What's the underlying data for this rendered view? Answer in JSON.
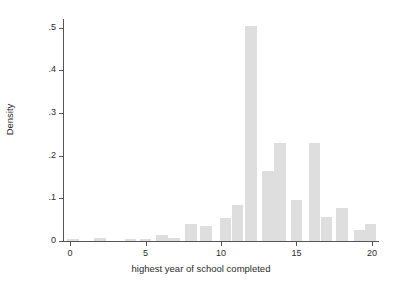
{
  "chart_data": {
    "type": "bar",
    "title": "",
    "subtitle": "",
    "xlabel": "highest year of school completed",
    "ylabel": "Density",
    "xlim": [
      -0.4,
      20.4
    ],
    "ylim": [
      0,
      0.52
    ],
    "xticks": [
      "0",
      "5",
      "10",
      "15",
      "20"
    ],
    "xtick_values": [
      0,
      5,
      10,
      15,
      20
    ],
    "yticks": [
      "0",
      ".1",
      ".2",
      ".3",
      ".4",
      ".5"
    ],
    "ytick_values": [
      0,
      0.1,
      0.2,
      0.3,
      0.4,
      0.5
    ],
    "grid": false,
    "legend": "none",
    "bar_color": "#dedede",
    "axis_color": "#555555",
    "text_color": "#2b2b2b",
    "background": "#ffffff",
    "bin_width": 0.77,
    "x": [
      0.2,
      2.0,
      4.0,
      5.0,
      6.1,
      6.9,
      8.0,
      9.0,
      10.3,
      11.1,
      12.0,
      13.1,
      13.9,
      15.0,
      16.2,
      17.0,
      18.0,
      19.2,
      19.9
    ],
    "values": [
      0.004,
      0.008,
      0.004,
      0.004,
      0.013,
      0.006,
      0.039,
      0.036,
      0.054,
      0.085,
      0.503,
      0.163,
      0.229,
      0.096,
      0.23,
      0.056,
      0.078,
      0.025,
      0.041
    ],
    "bars": [
      {
        "x": 0.2,
        "density": 0.004
      },
      {
        "x": 2.0,
        "density": 0.008
      },
      {
        "x": 4.0,
        "density": 0.004
      },
      {
        "x": 5.0,
        "density": 0.004
      },
      {
        "x": 6.1,
        "density": 0.013
      },
      {
        "x": 6.9,
        "density": 0.006
      },
      {
        "x": 8.0,
        "density": 0.039
      },
      {
        "x": 9.0,
        "density": 0.036
      },
      {
        "x": 10.3,
        "density": 0.054
      },
      {
        "x": 11.1,
        "density": 0.085
      },
      {
        "x": 12.0,
        "density": 0.503
      },
      {
        "x": 13.1,
        "density": 0.163
      },
      {
        "x": 13.9,
        "density": 0.229
      },
      {
        "x": 15.0,
        "density": 0.096
      },
      {
        "x": 16.2,
        "density": 0.23
      },
      {
        "x": 17.0,
        "density": 0.056
      },
      {
        "x": 18.0,
        "density": 0.078
      },
      {
        "x": 19.2,
        "density": 0.025
      },
      {
        "x": 19.9,
        "density": 0.041
      }
    ]
  }
}
